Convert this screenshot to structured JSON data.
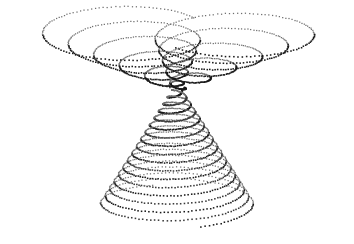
{
  "figure": {
    "title": "",
    "background_color": "#ffffff",
    "width": 354,
    "height": 244,
    "axes_visible": false,
    "grid_visible": false,
    "legend_visible": false,
    "tick_labels_visible": false,
    "marker": {
      "shape": "square-dot",
      "size_px": 1.4,
      "color": "#1a1a1a",
      "light_color": "#6e6e6e"
    }
  },
  "chart_data": {
    "type": "scatter",
    "title": "",
    "subtitle": "",
    "xlabel": "",
    "ylabel": "",
    "xlim": [
      0,
      354
    ],
    "ylim": [
      0,
      244
    ],
    "grid": false,
    "legend": "none",
    "projection": "3d-parametric-dotted",
    "series": [
      {
        "name": "left-upper-helix",
        "marker_color": "#1a1a1a",
        "point_count": 660,
        "turns": 5.4,
        "center_start_x": 176,
        "center_start_y": 88,
        "center_end_x": 118,
        "center_end_y": 30,
        "radius_x_start": 6,
        "radius_x_end": 86,
        "radius_y_start": 3,
        "radius_y_end": 26,
        "phase_deg": 188
      },
      {
        "name": "right-upper-helix",
        "marker_color": "#1a1a1a",
        "point_count": 660,
        "turns": 5.4,
        "center_start_x": 178,
        "center_start_y": 88,
        "center_end_x": 238,
        "center_end_y": 30,
        "radius_x_start": 6,
        "radius_x_end": 86,
        "radius_y_start": 3,
        "radius_y_end": 26,
        "phase_deg": 352
      },
      {
        "name": "lower-merged-helix-a",
        "marker_color": "#1a1a1a",
        "point_count": 900,
        "turns": 8.2,
        "center_start_x": 177,
        "center_start_y": 90,
        "center_end_x": 177,
        "center_end_y": 206,
        "radius_x_start": 5,
        "radius_x_end": 78,
        "radius_y_start": 2,
        "radius_y_end": 22,
        "phase_deg": 0
      },
      {
        "name": "lower-merged-helix-b",
        "marker_color": "#3a3a3a",
        "point_count": 900,
        "turns": 8.2,
        "center_start_x": 177,
        "center_start_y": 90,
        "center_end_x": 177,
        "center_end_y": 206,
        "radius_x_start": 5,
        "radius_x_end": 78,
        "radius_y_start": 2,
        "radius_y_end": 22,
        "phase_deg": 180
      }
    ],
    "extents": {
      "leftmost_x": 19,
      "rightmost_x": 336,
      "topmost_y": 7,
      "bottommost_y": 231,
      "waist_x": 177,
      "waist_y": 88
    }
  }
}
